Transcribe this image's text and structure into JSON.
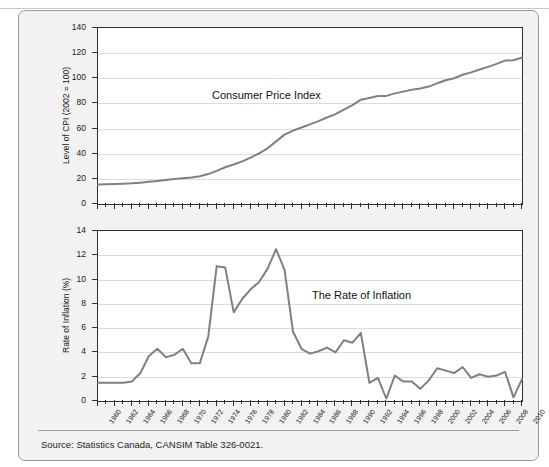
{
  "figure": {
    "source_note": "Source: Statistics Canada, CANSIM Table 326-0021."
  },
  "chart_data": [
    {
      "type": "line",
      "title": "Consumer Price Index",
      "xlabel": "",
      "ylabel": "Level of CPI (2002 = 100)",
      "xlim": [
        1960,
        2010
      ],
      "ylim": [
        0,
        140
      ],
      "yticks": [
        0,
        20,
        40,
        60,
        80,
        100,
        120,
        140
      ],
      "xticks": [
        1960,
        1962,
        1964,
        1966,
        1968,
        1970,
        1972,
        1974,
        1976,
        1978,
        1980,
        1982,
        1984,
        1986,
        1988,
        1990,
        1992,
        1994,
        1996,
        1998,
        2000,
        2002,
        2004,
        2006,
        2008,
        2010
      ],
      "grid": true,
      "legend": "none",
      "line_color": "#808080",
      "x": [
        1960,
        1961,
        1962,
        1963,
        1964,
        1965,
        1966,
        1967,
        1968,
        1969,
        1970,
        1971,
        1972,
        1973,
        1974,
        1975,
        1976,
        1977,
        1978,
        1979,
        1980,
        1981,
        1982,
        1983,
        1984,
        1985,
        1986,
        1987,
        1988,
        1989,
        1990,
        1991,
        1992,
        1993,
        1994,
        1995,
        1996,
        1997,
        1998,
        1999,
        2000,
        2001,
        2002,
        2003,
        2004,
        2005,
        2006,
        2007,
        2008,
        2009,
        2010
      ],
      "values": [
        15.5,
        15.7,
        15.9,
        16.2,
        16.5,
        17.0,
        17.6,
        18.3,
        19.0,
        19.8,
        20.4,
        21.0,
        22.1,
        23.8,
        26.4,
        29.2,
        31.4,
        33.9,
        36.9,
        40.3,
        44.3,
        49.8,
        55.2,
        58.4,
        60.9,
        63.3,
        65.9,
        68.8,
        71.5,
        75.0,
        78.6,
        83.0,
        84.3,
        85.9,
        86.0,
        88.0,
        89.4,
        90.9,
        91.8,
        93.4,
        96.0,
        98.4,
        100.0,
        102.8,
        104.7,
        107.0,
        109.1,
        111.5,
        114.1,
        114.4,
        116.5
      ]
    },
    {
      "type": "line",
      "title": "The Rate of Inflation",
      "xlabel": "",
      "ylabel": "Rate of Inflation (%)",
      "xlim": [
        1960,
        2010
      ],
      "ylim": [
        0,
        14
      ],
      "yticks": [
        0,
        2,
        4,
        6,
        8,
        10,
        12,
        14
      ],
      "xticks": [
        1960,
        1962,
        1964,
        1966,
        1968,
        1970,
        1972,
        1974,
        1976,
        1978,
        1980,
        1982,
        1984,
        1986,
        1988,
        1990,
        1992,
        1994,
        1996,
        1998,
        2000,
        2002,
        2004,
        2006,
        2008,
        2010
      ],
      "grid": true,
      "legend": "none",
      "line_color": "#808080",
      "x": [
        1960,
        1961,
        1962,
        1963,
        1964,
        1965,
        1966,
        1967,
        1968,
        1969,
        1970,
        1971,
        1972,
        1973,
        1974,
        1975,
        1976,
        1977,
        1978,
        1979,
        1980,
        1981,
        1982,
        1983,
        1984,
        1985,
        1986,
        1987,
        1988,
        1989,
        1990,
        1991,
        1992,
        1993,
        1994,
        1995,
        1996,
        1997,
        1998,
        1999,
        2000,
        2001,
        2002,
        2003,
        2004,
        2005,
        2006,
        2007,
        2008,
        2009,
        2010
      ],
      "values": [
        1.5,
        1.5,
        1.5,
        1.5,
        1.6,
        2.3,
        3.7,
        4.3,
        3.6,
        3.8,
        4.3,
        3.1,
        3.1,
        5.3,
        11.1,
        11.0,
        7.3,
        8.4,
        9.2,
        9.8,
        10.9,
        12.5,
        10.8,
        5.7,
        4.3,
        3.9,
        4.1,
        4.4,
        4.0,
        5.0,
        4.8,
        5.6,
        1.5,
        1.9,
        0.2,
        2.1,
        1.6,
        1.6,
        1.0,
        1.7,
        2.7,
        2.5,
        2.3,
        2.8,
        1.9,
        2.2,
        2.0,
        2.1,
        2.4,
        0.3,
        1.8
      ]
    }
  ]
}
